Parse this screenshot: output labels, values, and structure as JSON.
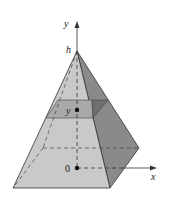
{
  "figure": {
    "type": "pyramid-cross-section",
    "labels": {
      "y_axis": "y",
      "x_axis": "x",
      "apex": "h",
      "slice": "y",
      "origin": "0"
    },
    "colors": {
      "front_face": "#c9c9c9",
      "right_face": "#8a8a8a",
      "slice_front": "#a9a9a9",
      "slice_right": "#6f6f6f",
      "edge": "#333333"
    }
  }
}
